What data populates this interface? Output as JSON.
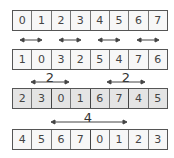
{
  "rows": [
    {
      "name": "original",
      "values": [
        "0",
        "1",
        "2",
        "3",
        "4",
        "5",
        "6",
        "7"
      ]
    },
    {
      "name": "swap-1",
      "values": [
        "1",
        "0",
        "3",
        "2",
        "5",
        "4",
        "7",
        "6"
      ]
    },
    {
      "name": "swap-2",
      "values": [
        "2",
        "3",
        "0",
        "1",
        "6",
        "7",
        "4",
        "5"
      ]
    },
    {
      "name": "swap-4",
      "values": [
        "4",
        "5",
        "6",
        "7",
        "0",
        "1",
        "2",
        "3"
      ]
    }
  ],
  "labels": {
    "distance_2_left": "2",
    "distance_2_right": "2",
    "distance_4": "4"
  },
  "colors": {
    "border": "#555555",
    "grey_fill": "#e4e4e4",
    "text": "#444444"
  }
}
